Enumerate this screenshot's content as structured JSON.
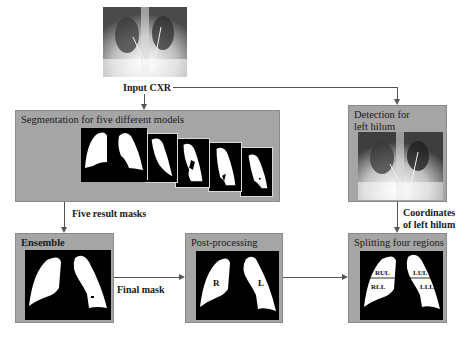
{
  "input": {
    "label": "Input CXR",
    "image": "chest-xray-image"
  },
  "segmentation": {
    "title": "Segmentation for five different models",
    "masks": [
      "model-1-mask",
      "model-2-mask",
      "model-3-mask",
      "model-4-mask",
      "model-5-mask"
    ]
  },
  "detection": {
    "title_line1": "Detection for",
    "title_line2": "left hilum",
    "image": "chest-xray-image"
  },
  "ensemble": {
    "title": "Ensemble"
  },
  "postprocessing": {
    "title": "Post-processing",
    "right_label": "R",
    "left_label": "L"
  },
  "splitting": {
    "title": "Splitting four regions",
    "regions": {
      "rul": "RUL",
      "lul": "LUL",
      "rll": "RLL",
      "lll": "LLL"
    }
  },
  "edges": {
    "five_result_masks": "Five result masks",
    "final_mask": "Final mask",
    "coordinates_line1": "Coordinates",
    "coordinates_line2": "of left hilum"
  },
  "colors": {
    "box_fill": "#a5a5a5",
    "arrow": "#555555",
    "mask_bg": "#000000",
    "mask_fg": "#ffffff"
  }
}
